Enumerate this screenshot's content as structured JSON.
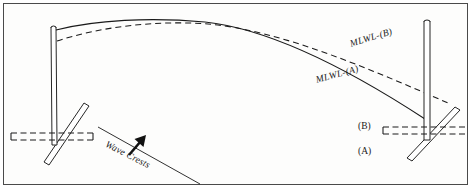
{
  "figure": {
    "background_color": "#fdfdfc",
    "frame_color": "#4a4a4a",
    "ink_color": "#1a1a1a"
  },
  "labels": {
    "mlwl_b": "MLWL-(B)",
    "mlwl_a": "MLWL-(A)",
    "level_b": "(B)",
    "level_a": "(A)",
    "wave_crests": "Wave Crests"
  },
  "curves": {
    "mlwl_a": {
      "name": "MLWL-(A)",
      "style": "solid",
      "description": "Solid arched curve spanning between the two piles, apex near left-of-center"
    },
    "mlwl_b": {
      "name": "MLWL-(B)",
      "style": "dashed",
      "description": "Dashed arched curve starting lower at left pile, converging at apex, ending lower-right at frame edge"
    }
  },
  "structures": {
    "left_pile": {
      "name": "left-pile",
      "type": "vertical-pile-with-diagonal-brace"
    },
    "right_pile": {
      "name": "right-pile",
      "type": "vertical-pile-with-diagonal-brace"
    }
  },
  "waterlines": {
    "left": {
      "style": "dashed-pair",
      "name": "left-waterline"
    },
    "right": {
      "style": "dashed-pair",
      "name": "right-waterline"
    }
  },
  "arrow": {
    "name": "wave-direction-arrow",
    "direction": "up-right",
    "description": "Bold solid arrow perpendicular to wave crest line"
  }
}
